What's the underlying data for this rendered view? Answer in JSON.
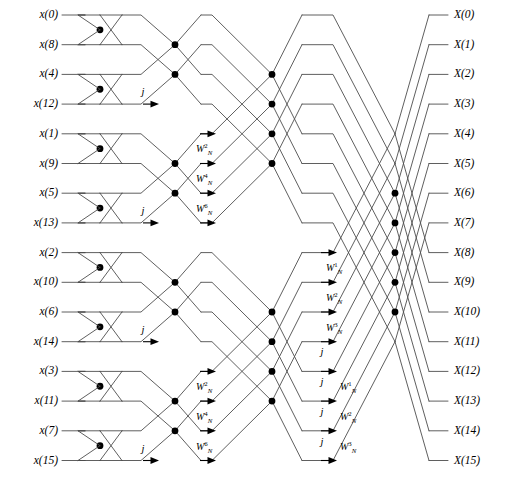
{
  "diagram": {
    "stage_count": 4,
    "point_count": 16,
    "line_color": "#4d4d4d",
    "node_color": "#000000",
    "background": "#ffffff"
  },
  "inputs": [
    {
      "label": "x(0)",
      "name": "x",
      "index": "(0)"
    },
    {
      "label": "x(8)",
      "name": "x",
      "index": "(8)"
    },
    {
      "label": "x(4)",
      "name": "x",
      "index": "(4)"
    },
    {
      "label": "x(12)",
      "name": "x",
      "index": "(12)"
    },
    {
      "label": "x(1)",
      "name": "x",
      "index": "(1)"
    },
    {
      "label": "x(9)",
      "name": "x",
      "index": "(9)"
    },
    {
      "label": "x(5)",
      "name": "x",
      "index": "(5)"
    },
    {
      "label": "x(13)",
      "name": "x",
      "index": "(13)"
    },
    {
      "label": "x(2)",
      "name": "x",
      "index": "(2)"
    },
    {
      "label": "x(10)",
      "name": "x",
      "index": "(10)"
    },
    {
      "label": "x(6)",
      "name": "x",
      "index": "(6)"
    },
    {
      "label": "x(14)",
      "name": "x",
      "index": "(14)"
    },
    {
      "label": "x(3)",
      "name": "x",
      "index": "(3)"
    },
    {
      "label": "x(11)",
      "name": "x",
      "index": "(11)"
    },
    {
      "label": "x(7)",
      "name": "x",
      "index": "(7)"
    },
    {
      "label": "x(15)",
      "name": "x",
      "index": "(15)"
    }
  ],
  "outputs": [
    {
      "label": "X(0)",
      "name": "X",
      "index": "(0)"
    },
    {
      "label": "X(1)",
      "name": "X",
      "index": "(1)"
    },
    {
      "label": "X(2)",
      "name": "X",
      "index": "(2)"
    },
    {
      "label": "X(3)",
      "name": "X",
      "index": "(3)"
    },
    {
      "label": "X(4)",
      "name": "X",
      "index": "(4)"
    },
    {
      "label": "X(5)",
      "name": "X",
      "index": "(5)"
    },
    {
      "label": "X(6)",
      "name": "X",
      "index": "(6)"
    },
    {
      "label": "X(7)",
      "name": "X",
      "index": "(7)"
    },
    {
      "label": "X(8)",
      "name": "X",
      "index": "(8)"
    },
    {
      "label": "X(9)",
      "name": "X",
      "index": "(9)"
    },
    {
      "label": "X(10)",
      "name": "X",
      "index": "(10)"
    },
    {
      "label": "X(11)",
      "name": "X",
      "index": "(11)"
    },
    {
      "label": "X(12)",
      "name": "X",
      "index": "(12)"
    },
    {
      "label": "X(13)",
      "name": "X",
      "index": "(13)"
    },
    {
      "label": "X(14)",
      "name": "X",
      "index": "(14)"
    },
    {
      "label": "X(15)",
      "name": "X",
      "index": "(15)"
    }
  ],
  "twiddles": [
    {
      "id": "s2-j-r3",
      "stage": 2,
      "row": 3,
      "text": "j",
      "kind": "j",
      "x": 143,
      "y": 92
    },
    {
      "id": "s2-j-r7",
      "stage": 2,
      "row": 7,
      "text": "j",
      "kind": "j",
      "x": 143,
      "y": 211
    },
    {
      "id": "s2-j-r11",
      "stage": 2,
      "row": 11,
      "text": "j",
      "kind": "j",
      "x": 143,
      "y": 330
    },
    {
      "id": "s2-j-r15",
      "stage": 2,
      "row": 15,
      "text": "j",
      "kind": "j",
      "x": 143,
      "y": 449
    },
    {
      "id": "s3-w2-a",
      "stage": 3,
      "row": 5,
      "base": "W",
      "sub": "N",
      "sup": "2",
      "kind": "W",
      "x": 196,
      "y": 150
    },
    {
      "id": "s3-w4-a",
      "stage": 3,
      "row": 6,
      "base": "W",
      "sub": "N",
      "sup": "4",
      "kind": "W",
      "x": 196,
      "y": 180
    },
    {
      "id": "s3-w6-a",
      "stage": 3,
      "row": 7,
      "base": "W",
      "sub": "N",
      "sup": "6",
      "kind": "W",
      "x": 196,
      "y": 210
    },
    {
      "id": "s3-w2-b",
      "stage": 3,
      "row": 13,
      "base": "W",
      "sub": "N",
      "sup": "2",
      "kind": "W",
      "x": 196,
      "y": 388
    },
    {
      "id": "s3-w4-b",
      "stage": 3,
      "row": 14,
      "base": "W",
      "sub": "N",
      "sup": "4",
      "kind": "W",
      "x": 196,
      "y": 418
    },
    {
      "id": "s3-w6-b",
      "stage": 3,
      "row": 15,
      "base": "W",
      "sub": "N",
      "sup": "6",
      "kind": "W",
      "x": 196,
      "y": 448
    },
    {
      "id": "s4-w1-a",
      "stage": 4,
      "row": 9,
      "base": "W",
      "sub": "N",
      "sup": "1",
      "kind": "W",
      "x": 326,
      "y": 269
    },
    {
      "id": "s4-w2-a",
      "stage": 4,
      "row": 10,
      "base": "W",
      "sub": "N",
      "sup": "2",
      "kind": "W",
      "x": 326,
      "y": 299
    },
    {
      "id": "s4-w3-a",
      "stage": 4,
      "row": 11,
      "base": "W",
      "sub": "N",
      "sup": "3",
      "kind": "W",
      "x": 326,
      "y": 329
    },
    {
      "id": "s4-j-r12",
      "stage": 4,
      "row": 12,
      "text": "j",
      "kind": "j",
      "x": 322,
      "y": 352
    },
    {
      "id": "s4-j-r13",
      "stage": 4,
      "row": 13,
      "text": "j",
      "kind": "j",
      "x": 322,
      "y": 382
    },
    {
      "id": "s4-w1-b",
      "stage": 4,
      "row": 13,
      "base": "W",
      "sub": "N",
      "sup": "1",
      "kind": "W",
      "x": 340,
      "y": 388
    },
    {
      "id": "s4-j-r14",
      "stage": 4,
      "row": 14,
      "text": "j",
      "kind": "j",
      "x": 322,
      "y": 412
    },
    {
      "id": "s4-w2-b",
      "stage": 4,
      "row": 14,
      "base": "W",
      "sub": "N",
      "sup": "2",
      "kind": "W",
      "x": 340,
      "y": 418
    },
    {
      "id": "s4-j-r15",
      "stage": 4,
      "row": 15,
      "text": "j",
      "kind": "j",
      "x": 322,
      "y": 442
    },
    {
      "id": "s4-w3-b",
      "stage": 4,
      "row": 15,
      "base": "W",
      "sub": "N",
      "sup": "3",
      "kind": "W",
      "x": 340,
      "y": 448
    }
  ],
  "geometry": {
    "row0_y": 15,
    "row_step": 29.7,
    "input_line_x0": 62,
    "input_line_x1": 95,
    "stage1_node_x": 100,
    "stage2_node_x": 175,
    "stage3_node_x": 272,
    "stage4_node_x": 395,
    "output_line_x1": 448
  }
}
